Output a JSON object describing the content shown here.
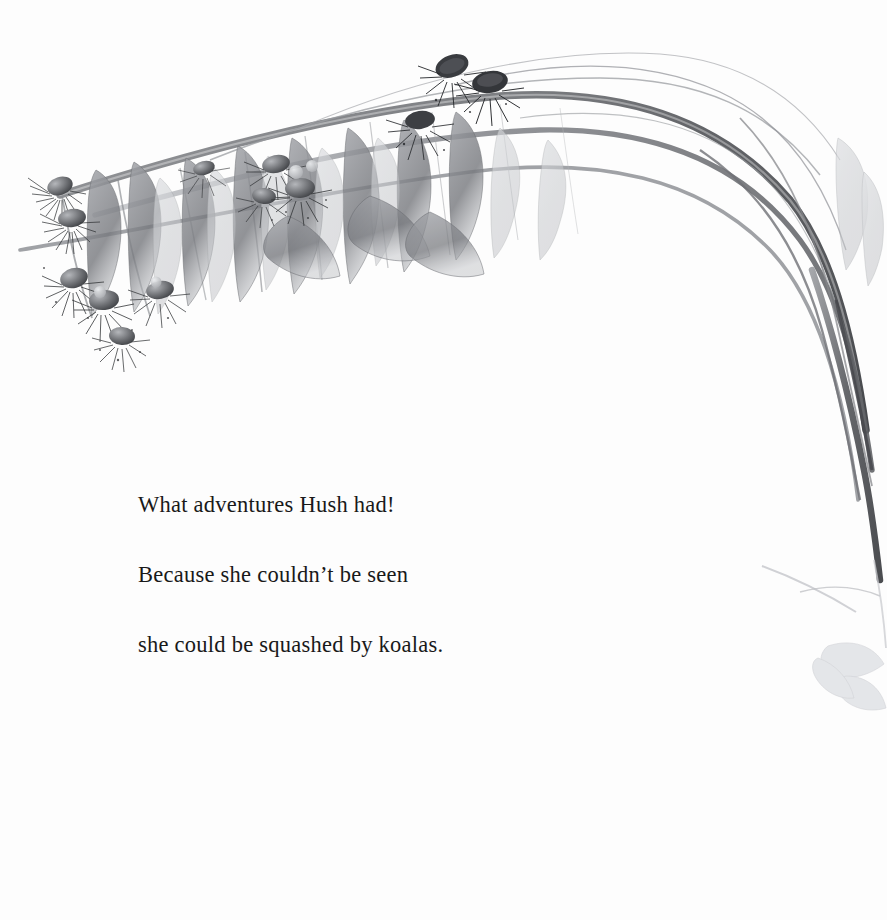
{
  "page": {
    "background_color": "#fdfdfd",
    "width": 887,
    "height": 920,
    "kind": "picture-book-page"
  },
  "caption": {
    "text_color": "#191919",
    "lines": [
      "What adventures Hush had!",
      "Because she couldn’t be seen",
      "she could be squashed by koalas."
    ],
    "full_text": "What adventures Hush had! Because she couldn’t be seen she could be squashed by koalas."
  },
  "illustration": {
    "title": "Eucalyptus branch with gum blossoms",
    "medium": "grayscale watercolour and pencil",
    "palette": {
      "darkest": "#2b2b2d",
      "mid_gray": "#6e7074",
      "light_gray": "#a9abaf",
      "pale_wash": "#d6d8db",
      "faintest": "#eceef0"
    },
    "elements": [
      {
        "name": "main-arching-branch",
        "note": "thick stem arcing from upper-left across to lower-right"
      },
      {
        "name": "secondary-stems",
        "note": "several thin arcs converging at right edge"
      },
      {
        "name": "blossom-cluster-top",
        "note": "dark gum blossoms near top centre"
      },
      {
        "name": "blossom-cluster-left",
        "note": "hanging blossoms at far left"
      },
      {
        "name": "blossom-cluster-lower-left",
        "note": "group of four blossoms low left"
      },
      {
        "name": "leaf-group-upper",
        "note": "lanceolate eucalyptus leaves hanging down"
      },
      {
        "name": "leaf-group-faint-lower-right",
        "note": "very pale leaves at lower right edge"
      },
      {
        "name": "twig-lower-right",
        "note": "faint twig crossing the lower right"
      }
    ]
  }
}
